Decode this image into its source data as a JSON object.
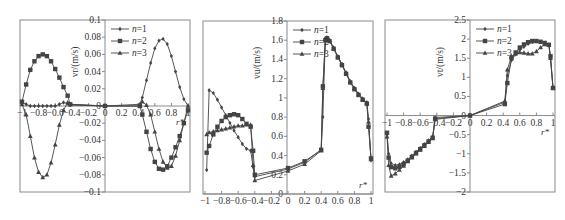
{
  "figure": {
    "width": 565,
    "height": 220,
    "ink_color": "#444444",
    "frame_color": "#8a8a8a",
    "legend_labels": [
      "n=1",
      "n=2",
      "n=3"
    ]
  },
  "chart_data": [
    {
      "type": "line",
      "panel": "a",
      "ylabel": "v_r/(m/s)",
      "xlabel": "r*",
      "xlim": [
        -1,
        1
      ],
      "ylim": [
        -0.1,
        0.1
      ],
      "xticks": [
        -1,
        -0.8,
        -0.6,
        -0.4,
        -0.2,
        0,
        0.2,
        0.4,
        0.6,
        0.8,
        1
      ],
      "xtick_labels": [
        "−1",
        "−0.8",
        "−0.6",
        "−0.4",
        "−0.2",
        "0",
        "0.2",
        "0.4",
        "0.6",
        "0.8",
        "1"
      ],
      "yticks": [
        -0.1,
        -0.08,
        -0.06,
        -0.04,
        -0.02,
        0,
        0.02,
        0.04,
        0.06,
        0.08,
        0.1
      ],
      "ytick_labels": [
        "−0.1",
        "−0.08",
        "−0.06",
        "−0.04",
        "−0.02",
        "0",
        "0.02",
        "0.04",
        "0.06",
        "0.08",
        "0.1"
      ],
      "grid": false,
      "legend": {
        "position": "upper-right-of-yaxis",
        "entries": [
          "n=1",
          "n=2",
          "n=3"
        ]
      },
      "frame_px": {
        "left": 20,
        "right": 190,
        "top": 20,
        "bottom": 192,
        "yaxis_x": 105
      },
      "series": [
        {
          "name": "n=1",
          "marker": "diamond",
          "x": [
            -1,
            -0.95,
            -0.9,
            -0.85,
            -0.8,
            -0.75,
            -0.7,
            -0.65,
            -0.6,
            -0.55,
            -0.5,
            -0.45,
            -0.42,
            0,
            0.42,
            0.45,
            0.5,
            0.55,
            0.6,
            0.65,
            0.7,
            0.75,
            0.8,
            0.85,
            0.9,
            0.95,
            1
          ],
          "y": [
            0.004,
            0.002,
            0.0,
            0.0,
            0.0,
            0.0,
            0.0,
            0.0,
            0.0,
            0.002,
            0.004,
            0.003,
            0.001,
            0.0,
            0.002,
            0.01,
            0.03,
            0.05,
            0.067,
            0.076,
            0.078,
            0.072,
            0.058,
            0.04,
            0.022,
            0.008,
            0.0
          ]
        },
        {
          "name": "n=2",
          "marker": "square",
          "x": [
            -1,
            -0.95,
            -0.9,
            -0.85,
            -0.8,
            -0.75,
            -0.7,
            -0.65,
            -0.6,
            -0.55,
            -0.5,
            -0.45,
            -0.42,
            0,
            0.42,
            0.45,
            0.5,
            0.55,
            0.6,
            0.65,
            0.7,
            0.75,
            0.8,
            0.85,
            0.9,
            0.95,
            1
          ],
          "y": [
            0.005,
            0.025,
            0.042,
            0.052,
            0.058,
            0.06,
            0.058,
            0.052,
            0.043,
            0.033,
            0.022,
            0.012,
            0.002,
            0.0,
            0.0,
            -0.01,
            -0.03,
            -0.05,
            -0.065,
            -0.073,
            -0.074,
            -0.07,
            -0.06,
            -0.048,
            -0.035,
            -0.02,
            -0.005
          ]
        },
        {
          "name": "n=3",
          "marker": "triangle",
          "x": [
            -1,
            -0.95,
            -0.9,
            -0.85,
            -0.8,
            -0.75,
            -0.7,
            -0.65,
            -0.6,
            -0.55,
            -0.5,
            -0.45,
            -0.42,
            0,
            0.42,
            0.45,
            0.5,
            0.55,
            0.6,
            0.65,
            0.7,
            0.75,
            0.8,
            0.85,
            0.9,
            0.95,
            1
          ],
          "y": [
            0.002,
            -0.01,
            -0.035,
            -0.06,
            -0.077,
            -0.083,
            -0.08,
            -0.066,
            -0.045,
            -0.022,
            -0.005,
            0.004,
            0.002,
            0.0,
            0.0,
            0.005,
            0.001,
            -0.01,
            -0.03,
            -0.05,
            -0.065,
            -0.072,
            -0.07,
            -0.058,
            -0.04,
            -0.02,
            0.0
          ]
        }
      ]
    },
    {
      "type": "line",
      "panel": "b",
      "ylabel": "v_u/(m/s)",
      "xlabel": "r*",
      "xlim": [
        -1,
        1
      ],
      "ylim": [
        0,
        1.8
      ],
      "xticks": [
        -1,
        -0.8,
        -0.6,
        -0.4,
        -0.2,
        0,
        0.2,
        0.4,
        0.6,
        0.8,
        1
      ],
      "xtick_labels": [
        "−1",
        "−0.8",
        "−0.6",
        "−0.4",
        "−0.2",
        "0",
        "0.2",
        "0.4",
        "0.6",
        "0.8",
        "1"
      ],
      "yticks": [
        0,
        0.2,
        0.4,
        0.6,
        0.8,
        1,
        1.2,
        1.4,
        1.6,
        1.8
      ],
      "ytick_labels": [
        "0",
        "0.2",
        "0.4",
        "0.6",
        "0.8",
        "1",
        "1.2",
        "1.4",
        "1.6",
        "1.8"
      ],
      "grid": false,
      "legend": {
        "position": "upper-right-of-yaxis",
        "entries": [
          "n=1",
          "n=2",
          "n=3"
        ]
      },
      "frame_px": {
        "left": 203,
        "right": 373,
        "top": 21,
        "bottom": 194,
        "yaxis_x": 287
      },
      "series": [
        {
          "name": "n=1",
          "marker": "diamond",
          "x": [
            -0.98,
            -0.95,
            -0.9,
            -0.85,
            -0.8,
            -0.75,
            -0.7,
            -0.65,
            -0.6,
            -0.55,
            -0.5,
            -0.45,
            -0.42,
            -0.4,
            0,
            0.2,
            0.4,
            0.42,
            0.45,
            0.47,
            0.5,
            0.55,
            0.6,
            0.65,
            0.7,
            0.75,
            0.8,
            0.85,
            0.9,
            0.95,
            0.97,
            1
          ],
          "y": [
            0.25,
            1.08,
            1.05,
            0.98,
            0.9,
            0.82,
            0.74,
            0.66,
            0.59,
            0.52,
            0.47,
            0.45,
            0.28,
            0.18,
            0.26,
            0.33,
            0.46,
            0.8,
            1.62,
            1.63,
            1.6,
            1.52,
            1.43,
            1.35,
            1.26,
            1.17,
            1.1,
            1.04,
            0.99,
            0.95,
            0.78,
            0.35
          ]
        },
        {
          "name": "n=2",
          "marker": "square",
          "x": [
            -0.98,
            -0.95,
            -0.9,
            -0.85,
            -0.8,
            -0.75,
            -0.7,
            -0.65,
            -0.6,
            -0.55,
            -0.5,
            -0.45,
            -0.42,
            -0.4,
            0,
            0.2,
            0.4,
            0.42,
            0.45,
            0.47,
            0.5,
            0.55,
            0.6,
            0.65,
            0.7,
            0.75,
            0.8,
            0.85,
            0.9,
            0.95,
            0.97,
            1
          ],
          "y": [
            0.43,
            0.5,
            0.62,
            0.7,
            0.76,
            0.8,
            0.82,
            0.83,
            0.82,
            0.78,
            0.73,
            0.7,
            0.45,
            0.2,
            0.27,
            0.34,
            0.46,
            1.12,
            1.6,
            1.62,
            1.59,
            1.51,
            1.42,
            1.34,
            1.25,
            1.16,
            1.09,
            1.03,
            0.98,
            0.94,
            0.7,
            0.37
          ]
        },
        {
          "name": "n=3",
          "marker": "triangle",
          "x": [
            -0.98,
            -0.95,
            -0.9,
            -0.85,
            -0.8,
            -0.75,
            -0.7,
            -0.65,
            -0.6,
            -0.55,
            -0.5,
            -0.45,
            -0.42,
            -0.4,
            0,
            0.2,
            0.4,
            0.42,
            0.45,
            0.47,
            0.5,
            0.55,
            0.6,
            0.65,
            0.7,
            0.75,
            0.8,
            0.85,
            0.9,
            0.95,
            0.97,
            1
          ],
          "y": [
            0.62,
            0.64,
            0.65,
            0.66,
            0.67,
            0.68,
            0.69,
            0.7,
            0.71,
            0.71,
            0.72,
            0.72,
            0.3,
            0.14,
            0.24,
            0.31,
            0.45,
            1.1,
            1.61,
            1.62,
            1.6,
            1.52,
            1.43,
            1.35,
            1.26,
            1.17,
            1.1,
            1.04,
            0.99,
            0.95,
            0.75,
            0.36
          ]
        }
      ]
    },
    {
      "type": "line",
      "panel": "c",
      "ylabel": "v_t/(m/s)",
      "xlabel": "r*",
      "xlim": [
        -1,
        1
      ],
      "ylim": [
        -2,
        2.5
      ],
      "xticks": [
        -1,
        -0.8,
        -0.6,
        -0.4,
        -0.2,
        0,
        0.2,
        0.4,
        0.6,
        0.8,
        1
      ],
      "xtick_labels": [
        "−1",
        "−0.8",
        "−0.6",
        "−0.4",
        "−0.2",
        "0",
        "0.2",
        "0.4",
        "0.6",
        "0.8",
        "1"
      ],
      "yticks": [
        -2,
        -1.5,
        -1,
        -0.5,
        0,
        0.5,
        1,
        1.5,
        2,
        2.5
      ],
      "ytick_labels": [
        "−2",
        "−1.5",
        "−1",
        "−0.5",
        "0",
        "0.5",
        "1",
        "1.5",
        "2",
        "2.5"
      ],
      "grid": false,
      "legend": {
        "position": "upper-right-of-yaxis",
        "entries": [
          "n=1",
          "n=2",
          "n=3"
        ]
      },
      "frame_px": {
        "left": 385,
        "right": 555,
        "top": 20,
        "bottom": 192,
        "yaxis_x": 470
      },
      "series": [
        {
          "name": "n=1",
          "marker": "diamond",
          "x": [
            -1,
            -0.98,
            -0.95,
            -0.9,
            -0.85,
            -0.8,
            -0.75,
            -0.7,
            -0.65,
            -0.6,
            -0.55,
            -0.5,
            -0.45,
            -0.42,
            0,
            0.42,
            0.45,
            0.5,
            0.55,
            0.6,
            0.65,
            0.7,
            0.75,
            0.8,
            0.85,
            0.9,
            0.95,
            0.97,
            1
          ],
          "y": [
            -0.5,
            -1.0,
            -1.25,
            -1.3,
            -1.28,
            -1.22,
            -1.15,
            -1.05,
            -0.95,
            -0.85,
            -0.75,
            -0.65,
            -0.55,
            -0.05,
            0.0,
            0.35,
            1.05,
            1.45,
            1.6,
            1.72,
            1.8,
            1.88,
            1.92,
            1.94,
            1.93,
            1.9,
            1.85,
            1.5,
            0.72
          ]
        },
        {
          "name": "n=2",
          "marker": "square",
          "x": [
            -1,
            -0.98,
            -0.95,
            -0.9,
            -0.85,
            -0.8,
            -0.75,
            -0.7,
            -0.65,
            -0.6,
            -0.55,
            -0.5,
            -0.45,
            -0.42,
            0,
            0.42,
            0.45,
            0.5,
            0.55,
            0.6,
            0.65,
            0.7,
            0.75,
            0.8,
            0.85,
            0.9,
            0.95,
            0.97,
            1
          ],
          "y": [
            -0.45,
            -1.1,
            -1.35,
            -1.38,
            -1.34,
            -1.27,
            -1.18,
            -1.08,
            -0.98,
            -0.88,
            -0.78,
            -0.68,
            -0.58,
            -0.08,
            0.0,
            0.3,
            0.85,
            1.5,
            1.65,
            1.78,
            1.86,
            1.92,
            1.95,
            1.95,
            1.93,
            1.9,
            1.85,
            1.55,
            0.72
          ]
        },
        {
          "name": "n=3",
          "marker": "triangle",
          "x": [
            -1,
            -0.98,
            -0.95,
            -0.9,
            -0.85,
            -0.8,
            -0.75,
            -0.7,
            -0.65,
            -0.6,
            -0.55,
            -0.5,
            -0.45,
            -0.42,
            0,
            0.42,
            0.45,
            0.5,
            0.55,
            0.6,
            0.65,
            0.7,
            0.75,
            0.8,
            0.85,
            0.9,
            0.95,
            0.97,
            1
          ],
          "y": [
            -0.55,
            -1.3,
            -1.58,
            -1.52,
            -1.42,
            -1.32,
            -1.2,
            -1.1,
            -1.0,
            -0.9,
            -0.8,
            -0.7,
            -0.6,
            -0.1,
            0.0,
            0.38,
            1.2,
            1.55,
            1.62,
            1.65,
            1.64,
            1.62,
            1.62,
            1.68,
            1.78,
            1.86,
            1.85,
            1.5,
            0.72
          ]
        }
      ]
    }
  ]
}
